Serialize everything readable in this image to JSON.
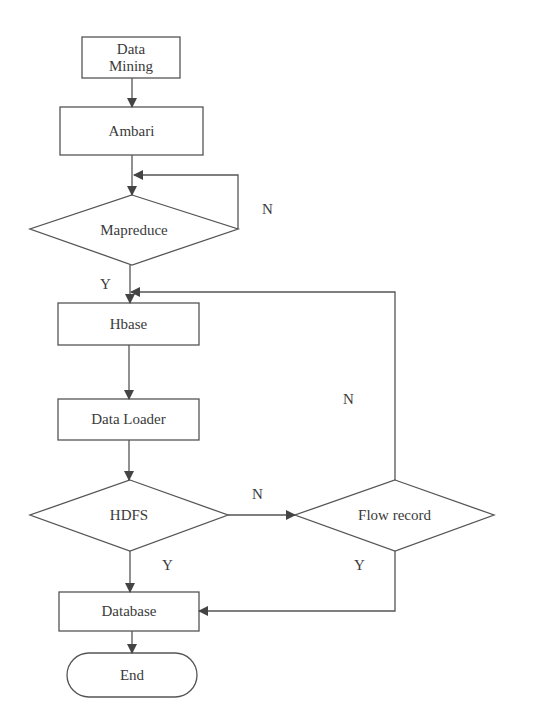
{
  "diagram": {
    "type": "flowchart",
    "nodes": [
      {
        "id": "data-mining",
        "shape": "rect",
        "label": "Data Mining",
        "line1": "Data",
        "line2": "Mining"
      },
      {
        "id": "ambari",
        "shape": "rect",
        "label": "Ambari"
      },
      {
        "id": "mapreduce",
        "shape": "diamond",
        "label": "Mapreduce"
      },
      {
        "id": "hbase",
        "shape": "rect",
        "label": "Hbase"
      },
      {
        "id": "data-loader",
        "shape": "rect",
        "label": "Data Loader"
      },
      {
        "id": "hdfs",
        "shape": "diamond",
        "label": "HDFS"
      },
      {
        "id": "flow-record",
        "shape": "diamond",
        "label": "Flow record"
      },
      {
        "id": "database",
        "shape": "rect",
        "label": "Database"
      },
      {
        "id": "end",
        "shape": "terminator",
        "label": "End"
      }
    ],
    "edges": [
      {
        "from": "data-mining",
        "to": "ambari",
        "label": ""
      },
      {
        "from": "ambari",
        "to": "mapreduce",
        "label": ""
      },
      {
        "from": "mapreduce",
        "to": "mapreduce",
        "label": "N"
      },
      {
        "from": "mapreduce",
        "to": "hbase",
        "label": "Y"
      },
      {
        "from": "hbase",
        "to": "data-loader",
        "label": ""
      },
      {
        "from": "data-loader",
        "to": "hdfs",
        "label": ""
      },
      {
        "from": "hdfs",
        "to": "flow-record",
        "label": "N"
      },
      {
        "from": "hdfs",
        "to": "database",
        "label": "Y"
      },
      {
        "from": "flow-record",
        "to": "hbase",
        "label": "N"
      },
      {
        "from": "flow-record",
        "to": "database",
        "label": "Y"
      },
      {
        "from": "database",
        "to": "end",
        "label": ""
      }
    ],
    "edge_labels": {
      "mapreduce_n": "N",
      "mapreduce_y": "Y",
      "flow_record_n": "N",
      "hdfs_n": "N",
      "hdfs_y": "Y",
      "flow_record_y": "Y"
    },
    "colors": {
      "stroke": "#555555",
      "background": "#ffffff",
      "text": "#3a3a3a"
    }
  }
}
